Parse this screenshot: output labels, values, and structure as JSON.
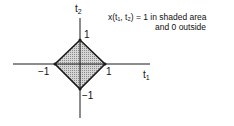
{
  "diagram": {
    "axes": {
      "horizontal": {
        "label": "t",
        "subscript": "1"
      },
      "vertical": {
        "label": "t",
        "subscript": "2"
      }
    },
    "ticks": {
      "top": "1",
      "right": "1",
      "left": "−1",
      "bottom": "−1"
    },
    "annotation": {
      "line1": "x(t₁, t₂) = 1 in shaded area",
      "line2": "and 0 outside"
    },
    "colors": {
      "shade": "#bdbdbd",
      "line": "#1a1a1a"
    }
  }
}
